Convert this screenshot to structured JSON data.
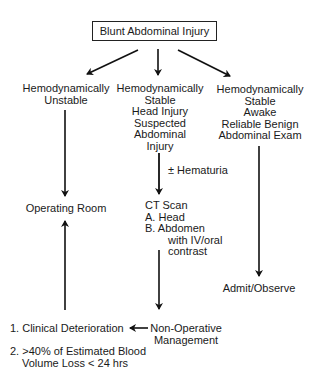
{
  "diagram": {
    "title": "Blunt Abdominal Injury",
    "branches": {
      "unstable": {
        "lines": [
          "Hemodynamically",
          "Unstable"
        ]
      },
      "stable_head": {
        "lines": [
          "Hemodynamically",
          "Stable",
          "Head Injury",
          "Suspected",
          "Abdominal",
          "Injury"
        ]
      },
      "stable_awake": {
        "lines": [
          "Hemodynamically",
          "Stable",
          "Awake",
          "Reliable Benign",
          "Abdominal Exam"
        ]
      }
    },
    "hematuria_label": "± Hematuria",
    "operating_room": "Operating Room",
    "ct_scan": {
      "lines": [
        "CT Scan",
        "A. Head",
        "B. Abdomen"
      ],
      "sub_lines": [
        "with IV/oral",
        "contrast"
      ]
    },
    "admit_observe": "Admit/Observe",
    "non_operative": {
      "lines": [
        "Non-Operative",
        "Management"
      ]
    },
    "criteria": [
      {
        "lines": [
          "1. Clinical Deterioration"
        ]
      },
      {
        "lines": [
          "2. >40% of Estimated Blood",
          "Volume Loss < 24 hrs"
        ]
      }
    ]
  }
}
